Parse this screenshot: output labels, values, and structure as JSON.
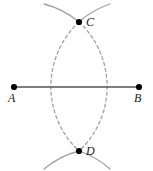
{
  "figure": {
    "width": 153,
    "height": 171,
    "background_color": "#ffffff"
  },
  "style": {
    "segment_color": "#555555",
    "segment_width": 1.6,
    "arc_color": "#a0a0a0",
    "arc_width": 1.3,
    "arc_dash_pattern": "3,3",
    "point_color": "#000000",
    "point_radius": 3.1,
    "label_color": "#1a1a1a",
    "label_font_size": 12
  },
  "segment": {
    "name": "AB",
    "x1": 14,
    "y1": 87,
    "x2": 139,
    "y2": 87
  },
  "points": [
    {
      "id": "A",
      "label": "A",
      "x": 14,
      "y": 87,
      "label_x": 8,
      "label_y": 92
    },
    {
      "id": "B",
      "label": "B",
      "x": 139,
      "y": 87,
      "label_x": 134,
      "label_y": 92
    },
    {
      "id": "C",
      "label": "C",
      "x": 79,
      "y": 22,
      "label_x": 86,
      "label_y": 16
    },
    {
      "id": "D",
      "label": "D",
      "x": 79,
      "y": 151,
      "label_x": 86,
      "label_y": 145
    }
  ],
  "arcs": [
    {
      "id": "arc-from-A",
      "center": "A",
      "center_x": 14,
      "center_y": 87,
      "radius": 88,
      "description": "compass arc centered at A passing through C and D",
      "solid_top_path": "M 44 4 A 88 88 0 0 1 79 22",
      "dashed_path": "M 79 22 A 88 88 0 0 0 79 151",
      "solid_bottom_path": "M 79 151 A 88 88 0 0 0 44 169"
    },
    {
      "id": "arc-from-B",
      "center": "B",
      "center_x": 139,
      "center_y": 87,
      "radius": 88,
      "description": "compass arc centered at B passing through C and D",
      "solid_top_path": "M 110 4 A 88 88 0 0 0 79 22",
      "dashed_path": "M 79 22 A 88 88 0 0 1 79 151",
      "solid_bottom_path": "M 79 151 A 88 88 0 0 1 110 169"
    }
  ]
}
